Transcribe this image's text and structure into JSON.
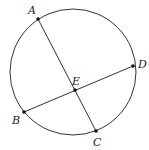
{
  "diagram": {
    "type": "circle-with-intersecting-chords",
    "circle": {
      "cx": 73,
      "cy": 72,
      "r": 63,
      "stroke": "#333333"
    },
    "points": [
      {
        "name": "A",
        "x": 38,
        "y": 19,
        "label_x": 28,
        "label_y": 14
      },
      {
        "name": "B",
        "x": 24,
        "y": 112,
        "label_x": 12,
        "label_y": 124
      },
      {
        "name": "C",
        "x": 96,
        "y": 131,
        "label_x": 93,
        "label_y": 146
      },
      {
        "name": "D",
        "x": 133,
        "y": 66,
        "label_x": 138,
        "label_y": 68
      },
      {
        "name": "E",
        "x": 75,
        "y": 90,
        "label_x": 72,
        "label_y": 85
      }
    ],
    "chords": [
      {
        "from": "A",
        "to": "C"
      },
      {
        "from": "B",
        "to": "D"
      }
    ],
    "intersection": "E"
  }
}
